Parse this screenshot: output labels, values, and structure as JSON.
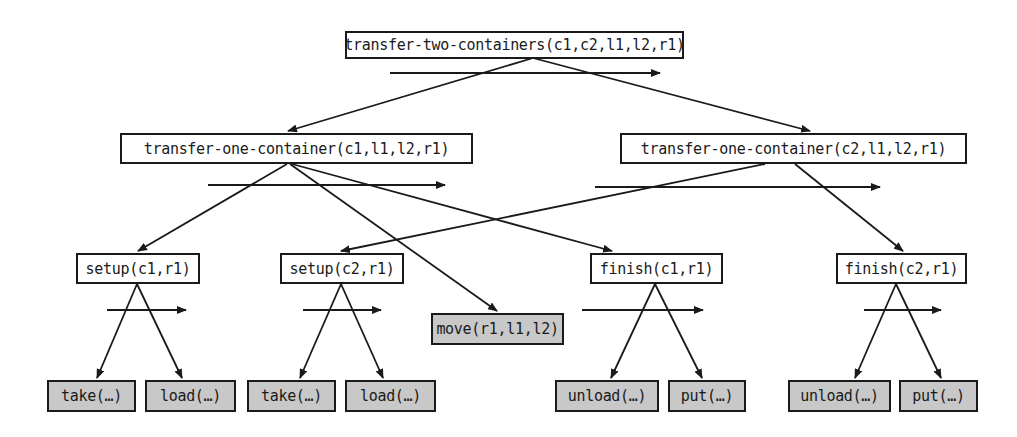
{
  "diagram": {
    "type": "HTN decomposition tree",
    "root": {
      "label": "transfer-two-containers(c1,c2,l1,l2,r1)"
    },
    "level1": [
      {
        "label": "transfer-one-container(c1,l1,l2,r1)"
      },
      {
        "label": "transfer-one-container(c2,l1,l2,r1)"
      }
    ],
    "level2": [
      {
        "label": "setup(c1,r1)"
      },
      {
        "label": "setup(c2,r1)"
      },
      {
        "label": "move(r1,l1,l2)",
        "primitive": true
      },
      {
        "label": "finish(c1,r1)"
      },
      {
        "label": "finish(c2,r1)"
      }
    ],
    "leaves": [
      {
        "label": "take(…)",
        "primitive": true
      },
      {
        "label": "load(…)",
        "primitive": true
      },
      {
        "label": "take(…)",
        "primitive": true
      },
      {
        "label": "load(…)",
        "primitive": true
      },
      {
        "label": "unload(…)",
        "primitive": true
      },
      {
        "label": "put(…)",
        "primitive": true
      },
      {
        "label": "unload(…)",
        "primitive": true
      },
      {
        "label": "put(…)",
        "primitive": true
      }
    ],
    "edges": [
      [
        "transfer-two-containers",
        "transfer-one-container(c1)"
      ],
      [
        "transfer-two-containers",
        "transfer-one-container(c2)"
      ],
      [
        "transfer-one-container(c1)",
        "setup(c1,r1)"
      ],
      [
        "transfer-one-container(c1)",
        "move(r1,l1,l2)"
      ],
      [
        "transfer-one-container(c1)",
        "finish(c1,r1)"
      ],
      [
        "transfer-one-container(c2)",
        "setup(c2,r1)"
      ],
      [
        "transfer-one-container(c2)",
        "finish(c2,r1)"
      ],
      [
        "setup(c1,r1)",
        "take(…)"
      ],
      [
        "setup(c1,r1)",
        "load(…)"
      ],
      [
        "setup(c2,r1)",
        "take(…)"
      ],
      [
        "setup(c2,r1)",
        "load(…)"
      ],
      [
        "finish(c1,r1)",
        "unload(…)"
      ],
      [
        "finish(c1,r1)",
        "put(…)"
      ],
      [
        "finish(c2,r1)",
        "unload(…)"
      ],
      [
        "finish(c2,r1)",
        "put(…)"
      ]
    ],
    "colors": {
      "compound_fill": "#ffffff",
      "primitive_fill": "#c8c8c8",
      "stroke": "#1a1a1a"
    }
  }
}
